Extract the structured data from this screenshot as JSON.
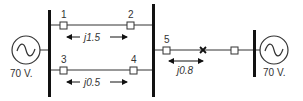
{
  "diagram": {
    "type": "power-system-one-line",
    "colors": {
      "line": "#333333",
      "bus": "#111111",
      "background": "#ffffff"
    },
    "generators": [
      {
        "id": "gen-left",
        "voltage_label": "70 V."
      },
      {
        "id": "gen-right",
        "voltage_label": "70 V."
      }
    ],
    "buses": [
      {
        "id": "bus-left"
      },
      {
        "id": "bus-middle"
      },
      {
        "id": "bus-right"
      }
    ],
    "breakers": [
      {
        "id": "1",
        "label": "1"
      },
      {
        "id": "2",
        "label": "2"
      },
      {
        "id": "3",
        "label": "3"
      },
      {
        "id": "4",
        "label": "4"
      },
      {
        "id": "5",
        "label": "5"
      },
      {
        "id": "6",
        "label": ""
      }
    ],
    "lines": [
      {
        "id": "line-12",
        "from": "1",
        "to": "2",
        "impedance": "j1.5"
      },
      {
        "id": "line-34",
        "from": "3",
        "to": "4",
        "impedance": "j0.5"
      },
      {
        "id": "line-5x",
        "from": "5",
        "to": "fault",
        "impedance": "j0.8"
      }
    ],
    "fault": {
      "symbol": "x"
    }
  }
}
